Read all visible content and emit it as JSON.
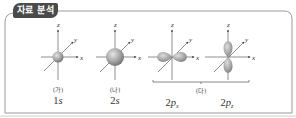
{
  "header": {
    "badge_label": "자료 분석"
  },
  "colors": {
    "badge_bg": "#4a4a4a",
    "badge_text": "#ffffff",
    "frame_border": "#8a8a8a",
    "axis": "#444444",
    "orbital_fill": "#9a9a9a",
    "orbital_highlight": "#d9d9d9"
  },
  "axes": {
    "x_label": "x",
    "y_label": "y",
    "z_label": "z"
  },
  "orbitals": [
    {
      "tag": "(가)",
      "name_main": "1s",
      "name_num": "1",
      "name_letter": "s",
      "name_sub": "",
      "shape": "small-sphere"
    },
    {
      "tag": "(나)",
      "name_main": "2s",
      "name_num": "2",
      "name_letter": "s",
      "name_sub": "",
      "shape": "large-sphere"
    },
    {
      "tag": "",
      "name_main": "2px",
      "name_num": "2",
      "name_letter": "p",
      "name_sub": "x",
      "shape": "dumbbell-x"
    },
    {
      "tag": "",
      "name_main": "2pz",
      "name_num": "2",
      "name_letter": "p",
      "name_sub": "z",
      "shape": "dumbbell-z"
    }
  ],
  "group": {
    "tag": "(다)",
    "members": [
      "2px",
      "2pz"
    ]
  }
}
